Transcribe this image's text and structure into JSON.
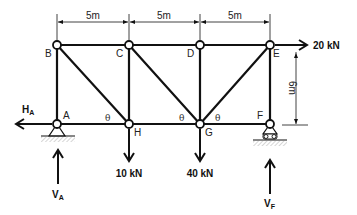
{
  "joints": [
    {
      "id": "A",
      "label": "A"
    },
    {
      "id": "B",
      "label": "B"
    },
    {
      "id": "C",
      "label": "C"
    },
    {
      "id": "D",
      "label": "D"
    },
    {
      "id": "E",
      "label": "E"
    },
    {
      "id": "F",
      "label": "F"
    },
    {
      "id": "G",
      "label": "G"
    },
    {
      "id": "H",
      "label": "H"
    }
  ],
  "members": [
    [
      "A",
      "B"
    ],
    [
      "B",
      "C"
    ],
    [
      "C",
      "D"
    ],
    [
      "D",
      "E"
    ],
    [
      "A",
      "H"
    ],
    [
      "H",
      "G"
    ],
    [
      "G",
      "F"
    ],
    [
      "C",
      "H"
    ],
    [
      "D",
      "G"
    ],
    [
      "E",
      "F"
    ],
    [
      "B",
      "H"
    ],
    [
      "C",
      "G"
    ],
    [
      "E",
      "G"
    ]
  ],
  "dimensions": {
    "panel_1": "5m",
    "panel_2": "5m",
    "panel_3": "5m",
    "height": "6m"
  },
  "angle_symbol": "θ",
  "loads": {
    "horizontal_E": "20 kN",
    "vertical_H": "10 kN",
    "vertical_G": "40 kN"
  },
  "reactions": {
    "HA": {
      "main": "H",
      "sub": "A"
    },
    "VA": {
      "main": "V",
      "sub": "A"
    },
    "VF": {
      "main": "V",
      "sub": "F"
    }
  },
  "supports": {
    "A": "pin",
    "F": "roller"
  }
}
